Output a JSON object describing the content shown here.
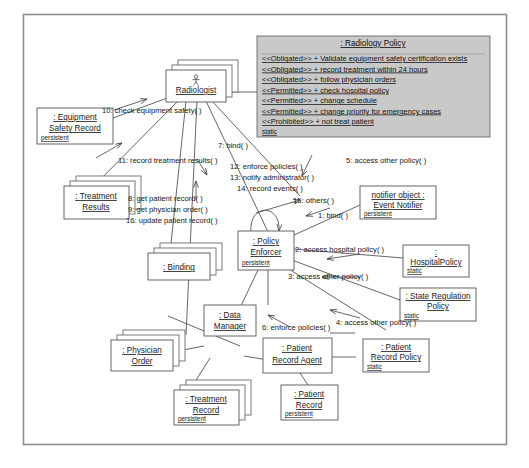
{
  "diagram": {
    "frame": {
      "x": 23,
      "y": 14,
      "width": 484,
      "height": 431
    },
    "caption": ""
  },
  "policy_box": {
    "name": ": Radiology Policy",
    "meta": "static",
    "fill": "#c9c9c9",
    "rules": [
      "<<Obligated>> + Validate equipment safety certification exists",
      "<<Obligated>> + record treatment within 24 hours",
      "<<Obligated>> + follow physician orders",
      "<<Permitted>> + check hospital policy",
      "<<Permitted>> + change schedule",
      "<<Permitted>> + change priority for emergency cases",
      "<<Prohibited>> + not treat patient"
    ]
  },
  "objects": [
    {
      "id": "radiologist",
      "line1": ": ",
      "line2": "Radiologist",
      "meta": "",
      "stacked": true,
      "actor": true
    },
    {
      "id": "equipment-safety",
      "line1": ": Equipment ",
      "line2": "Safety Record",
      "meta": "persistent",
      "stacked": false,
      "actor": false
    },
    {
      "id": "treatment-results",
      "line1": ": Treatment ",
      "line2": "Results",
      "meta": "",
      "stacked": true,
      "actor": false
    },
    {
      "id": "binding",
      "line1": ": Binding",
      "line2": "",
      "meta": "",
      "stacked": true,
      "actor": false
    },
    {
      "id": "policy-enforcer",
      "line1": ": Policy ",
      "line2": "Enforcer",
      "meta": "persistent",
      "stacked": false,
      "actor": false
    },
    {
      "id": "event-notifier",
      "line1": "notifier object : ",
      "line2": "Event Notifier",
      "meta": "persistent",
      "stacked": false,
      "actor": false
    },
    {
      "id": "hospital-policy",
      "line1": ": ",
      "line2": "HospitalPolicy",
      "meta": "static",
      "stacked": false,
      "actor": false
    },
    {
      "id": "state-regulation",
      "line1": ": State Regulation ",
      "line2": "Policy",
      "meta": "static",
      "stacked": false,
      "actor": false
    },
    {
      "id": "patient-record-policy",
      "line1": ": Patient ",
      "line2": "Record Policy",
      "meta": "static",
      "stacked": false,
      "actor": false
    },
    {
      "id": "data-manager",
      "line1": ": Data ",
      "line2": "Manager",
      "meta": "",
      "stacked": false,
      "actor": false
    },
    {
      "id": "physician-order",
      "line1": ": Physician ",
      "line2": "Order",
      "meta": "",
      "stacked": true,
      "actor": false
    },
    {
      "id": "treatment-record",
      "line1": ": Treatment ",
      "line2": "Record",
      "meta": "persistent",
      "stacked": true,
      "actor": false
    },
    {
      "id": "patient-record-agent",
      "line1": ": Patient ",
      "line2": "Record Agent",
      "meta": "",
      "stacked": false,
      "actor": false
    },
    {
      "id": "patient-record",
      "line1": ": Patient ",
      "line2": "Record",
      "meta": "persistent",
      "stacked": false,
      "actor": false
    }
  ],
  "messages": [
    {
      "id": "m10",
      "text": "10: check equipment safety( )"
    },
    {
      "id": "m7",
      "text": "7: bind( )"
    },
    {
      "id": "m11",
      "text": "11: record treatment results( )"
    },
    {
      "id": "m8",
      "text": "8: get patient record( )"
    },
    {
      "id": "m9",
      "text": "9: get physician order( )"
    },
    {
      "id": "m16",
      "text": "16: update patient record( )"
    },
    {
      "id": "m12",
      "text": "12: enforce policies( )"
    },
    {
      "id": "m13",
      "text": "13: notify administrator( )"
    },
    {
      "id": "m14",
      "text": "14: record events( )"
    },
    {
      "id": "m15",
      "text": "15: others( )"
    },
    {
      "id": "m5",
      "text": "5: access other policy( )"
    },
    {
      "id": "m1",
      "text": "1: bind( )"
    },
    {
      "id": "m2",
      "text": "2: access hospital policy( )"
    },
    {
      "id": "m3",
      "text": "3: access other policy( )"
    },
    {
      "id": "m6",
      "text": "6: enforce policies( )"
    },
    {
      "id": "m4",
      "text": "4: access other policy( )"
    }
  ]
}
